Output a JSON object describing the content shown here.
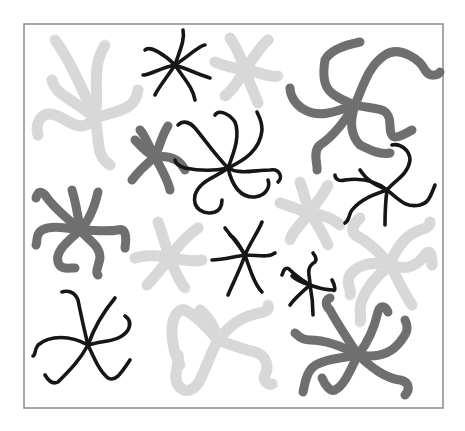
{
  "figure": {
    "frame": {
      "x": 24,
      "y": 24,
      "w": 419,
      "h": 384
    },
    "colors": {
      "light": "#e1e1e1",
      "dark": "#6f6f6f",
      "black": "#161616",
      "border": "#8a8a8a"
    },
    "stars": [
      {
        "id": "light-top-left",
        "shade": "light",
        "arms": [
          "M95 118 C75 100 55 95 52 80",
          "M95 118 C100 90 90 70 105 45",
          "M95 118 C120 110 135 110 138 90",
          "M95 118 C80 135 70 120 55 115 C40 110 35 125 38 135",
          "M95 118 C100 140 95 155 110 165",
          "M95 118 C85 95 70 60 55 40"
        ]
      },
      {
        "id": "black-top-center",
        "shade": "black",
        "arms": [
          "M175 65 C165 55 150 45 145 50",
          "M175 65 C180 50 185 40 183 30",
          "M175 65 C190 55 200 45 205 45",
          "M175 65 C190 70 200 75 210 78",
          "M175 65 C185 80 193 88 195 100",
          "M175 65 C165 80 158 88 155 95",
          "M175 65 C160 68 150 75 143 75"
        ]
      },
      {
        "id": "light-top-mid",
        "shade": "light",
        "arms": [
          "M245 70 C240 55 235 45 230 38",
          "M245 70 C255 55 262 45 268 40",
          "M245 70 C260 72 270 78 278 76",
          "M245 70 C250 85 255 95 258 103",
          "M245 70 C238 82 230 92 225 96",
          "M245 70 C232 68 222 65 215 62"
        ]
      },
      {
        "id": "dark-top-right",
        "shade": "dark",
        "arms": [
          "M355 105 C330 95 320 90 325 60 C330 50 345 45 360 42",
          "M355 105 C365 80 370 65 385 55 C400 45 420 60 425 70 C430 78 438 75 440 72",
          "M355 105 C375 110 390 105 390 125 C390 140 395 140 412 130",
          "M355 105 C345 120 335 135 320 145 C312 152 318 165 317 170",
          "M355 105 C350 120 350 135 360 145 C370 150 380 155 390 153",
          "M355 105 C335 112 320 118 305 110 C295 105 290 95 290 88"
        ]
      },
      {
        "id": "dark-mid-left",
        "shade": "dark",
        "arms": [
          "M155 157 C148 145 145 135 140 130",
          "M155 157 C160 145 162 135 168 126",
          "M155 157 C170 155 180 160 185 170",
          "M155 157 C162 170 168 180 170 190",
          "M155 157 C145 165 138 172 132 180",
          "M155 157 C145 152 140 145 135 140"
        ]
      },
      {
        "id": "black-center-curly",
        "shade": "black",
        "arms": [
          "M228 168 C215 155 205 140 195 128 C190 122 183 120 178 125",
          "M228 168 C235 150 240 135 235 122 C228 112 218 110 215 115",
          "M228 168 C245 160 260 150 262 130 C262 120 258 115 257 112",
          "M228 168 C240 175 255 170 270 170 C280 168 283 178 278 182",
          "M228 168 C232 185 240 198 255 197 C268 195 270 185 268 180",
          "M228 168 C215 178 200 180 195 195 C192 210 205 215 215 212 C220 210 222 205 222 200",
          "M228 168 C210 172 195 170 185 168 C178 166 175 162 175 160"
        ]
      },
      {
        "id": "black-right-mid",
        "shade": "black",
        "arms": [
          "M387 190 C375 180 360 178 345 180 C338 182 335 178 335 175",
          "M387 190 C395 180 408 175 410 160 C410 150 400 143 392 145",
          "M387 190 C400 200 405 208 420 205 C428 203 430 198 435 185",
          "M387 190 C385 205 385 215 385 225",
          "M387 190 C372 195 360 200 352 210 C348 215 350 220 345 223",
          "M387 190 C376 185 368 182 360 170"
        ]
      },
      {
        "id": "light-right-mid",
        "shade": "light",
        "arms": [
          "M310 213 C305 200 303 190 300 182",
          "M310 213 C318 200 325 192 328 185",
          "M310 213 C325 215 335 220 340 225",
          "M310 213 C318 225 325 238 328 245",
          "M310 213 C300 225 292 232 290 240",
          "M310 213 C298 210 288 205 280 203"
        ]
      },
      {
        "id": "dark-left",
        "shade": "dark",
        "arms": [
          "M80 230 C70 220 55 210 45 195 C40 190 38 192 36 198",
          "M80 230 C78 215 75 200 72 190",
          "M80 230 C90 220 95 205 98 192",
          "M80 230 C95 230 105 232 118 230 C125 228 127 235 125 248",
          "M80 230 C88 240 100 245 100 258 C98 268 95 272 98 275",
          "M80 230 C70 240 55 250 58 262 C60 270 68 268 75 268",
          "M80 230 C65 228 52 225 42 230 C35 235 38 240 36 245"
        ]
      },
      {
        "id": "light-left-center",
        "shade": "light",
        "arms": [
          "M170 258 C165 245 162 232 158 222",
          "M170 258 C178 245 188 235 198 228",
          "M170 258 C185 260 195 262 202 260",
          "M170 258 C175 272 180 282 185 288",
          "M170 258 C160 270 152 280 147 285",
          "M170 258 C158 255 145 255 135 258"
        ]
      },
      {
        "id": "black-center",
        "shade": "black",
        "arms": [
          "M245 255 C238 243 230 235 225 228",
          "M245 255 C250 243 258 232 262 222",
          "M245 255 C258 255 268 258 275 253",
          "M245 255 C250 270 255 285 262 292",
          "M245 255 C240 270 232 285 228 295",
          "M245 255 C232 257 222 260 212 260",
          "M245 255 C240 248 238 240 230 235"
        ]
      },
      {
        "id": "light-right-lower",
        "shade": "light",
        "arms": [
          "M390 265 C378 250 365 240 355 235 C350 228 355 222 360 218",
          "M390 265 C395 250 405 235 420 230 C428 228 430 225 430 222",
          "M390 265 C405 270 415 268 425 255 C430 248 432 255 432 265",
          "M390 265 C398 280 405 295 412 305",
          "M390 265 C378 275 368 285 362 300 C358 310 362 318 360 322",
          "M390 265 C375 262 360 262 350 275 C345 285 352 288 350 295"
        ]
      },
      {
        "id": "black-small-right",
        "shade": "black",
        "arms": [
          "M310 285 C302 280 295 275 290 270 C285 265 283 272 282 275",
          "M310 285 C310 275 305 268 315 262 C318 258 314 255 313 253",
          "M310 285 C318 288 325 290 333 290 C336 292 335 285 332 280",
          "M310 285 C312 295 313 305 313 315",
          "M310 285 C302 292 295 298 290 305",
          "M310 285 C303 283 296 280 292 276"
        ]
      },
      {
        "id": "black-bottom-left",
        "shade": "black",
        "arms": [
          "M88 345 C70 335 50 335 38 345 C34 350 36 355 33 356",
          "M88 345 C83 325 80 310 78 300 C75 292 68 290 62 292",
          "M88 345 C95 325 105 310 115 298",
          "M88 345 C105 340 120 342 128 330 C132 322 128 318 125 316",
          "M88 345 C95 360 100 372 108 378 C115 382 120 375 130 360",
          "M88 345 C80 360 70 370 58 382 C52 385 48 380 45 375"
        ]
      },
      {
        "id": "light-bottom-center",
        "shade": "light",
        "arms": [
          "M218 340 C205 325 195 315 185 310 C178 308 172 318 172 330 C172 345 175 355 180 365",
          "M218 340 C210 355 205 370 200 380 C195 390 185 395 178 385 C172 375 180 365 178 355",
          "M218 340 C230 325 240 318 252 315 C262 312 270 312 268 305",
          "M218 340 C232 345 245 350 255 352 C265 355 270 365 265 375 C262 380 268 385 272 384",
          "M218 340 C215 328 210 318 200 310"
        ]
      },
      {
        "id": "dark-bottom-right",
        "shade": "dark",
        "arms": [
          "M358 355 C345 335 335 320 330 310 C325 305 325 300 330 298",
          "M358 355 C370 340 375 325 378 312 C380 305 385 305 388 312",
          "M358 355 C375 358 390 355 400 342 C405 335 410 330 405 320",
          "M358 355 C372 368 385 378 400 380 C410 382 410 390 405 395",
          "M358 355 C350 370 345 385 335 390 C330 392 325 385 322 378",
          "M358 355 C340 358 320 360 312 368 C305 375 305 385 303 392",
          "M358 355 C340 345 325 340 310 340 C300 340 298 335 295 333"
        ]
      }
    ]
  }
}
